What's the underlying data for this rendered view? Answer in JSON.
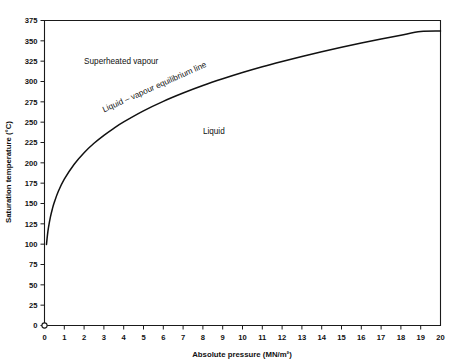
{
  "chart_data": {
    "type": "line",
    "title": "",
    "subtitle": "",
    "xlabel": "Absolute pressure (MN/m²)",
    "ylabel": "Saturation temperature (°C)",
    "xlim": [
      0,
      20
    ],
    "ylim": [
      0,
      375
    ],
    "grid": false,
    "legend_position": "none",
    "x_ticks": [
      0,
      1,
      2,
      3,
      4,
      5,
      6,
      7,
      8,
      9,
      10,
      11,
      12,
      13,
      14,
      15,
      16,
      17,
      18,
      19,
      20
    ],
    "x_tick_labels": [
      "0",
      "1",
      "2",
      "3",
      "4",
      "5",
      "6",
      "7",
      "8",
      "9",
      "10",
      "11",
      "12",
      "13",
      "14",
      "15",
      "16",
      "17",
      "18",
      "19",
      "20"
    ],
    "y_ticks": [
      0,
      25,
      50,
      75,
      100,
      125,
      150,
      175,
      200,
      225,
      250,
      275,
      300,
      325,
      350,
      375
    ],
    "y_tick_labels": [
      "0",
      "25",
      "50",
      "75",
      "100",
      "125",
      "150",
      "175",
      "200",
      "225",
      "250",
      "275",
      "300",
      "325",
      "350",
      "375"
    ],
    "series": [
      {
        "name": "Liquid – vapour equilibrium line",
        "color": "#111111",
        "x": [
          0.1,
          0.15,
          0.2,
          0.3,
          0.4,
          0.5,
          0.7,
          1.0,
          1.5,
          2.0,
          2.5,
          3.0,
          3.5,
          4.0,
          5.0,
          6.0,
          7.0,
          8.0,
          9.0,
          10.0,
          11.0,
          12.0,
          13.0,
          14.0,
          15.0,
          16.0,
          17.0,
          18.0,
          19.0,
          20.0
        ],
        "y": [
          99.6,
          111.4,
          120.2,
          133.5,
          143.6,
          151.8,
          165.0,
          179.9,
          198.3,
          212.4,
          224.0,
          233.8,
          242.5,
          250.3,
          263.9,
          275.6,
          285.8,
          295.0,
          303.3,
          311.0,
          318.1,
          324.6,
          330.8,
          336.6,
          342.1,
          347.3,
          352.3,
          357.0,
          361.4,
          362.0
        ],
        "marker": "none"
      }
    ],
    "annotations": [
      {
        "id": "superheated-vapour",
        "text": "Superheated vapour",
        "x": 2.0,
        "y": 322
      },
      {
        "id": "liquid",
        "text": "Liquid",
        "x": 8.0,
        "y": 235
      },
      {
        "id": "equilibrium-line",
        "text": "Liquid – vapour equilibrium line",
        "x": 3.0,
        "y": 262,
        "rotation": -24
      }
    ],
    "origin_marker": {
      "shape": "open-circle",
      "x": 0,
      "y": 0
    },
    "colors": {
      "curve": "#111111",
      "axis": "#1a1a1a",
      "text": "#111111",
      "background": "#ffffff"
    }
  }
}
